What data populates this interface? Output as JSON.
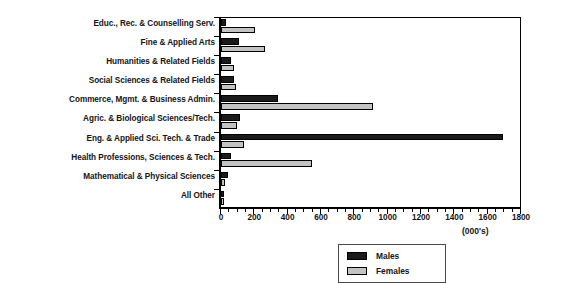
{
  "chart_data": {
    "type": "bar",
    "orientation": "horizontal",
    "title": "",
    "xlabel": "(000's)",
    "ylabel": "",
    "xlim": [
      0,
      1800
    ],
    "xticks": [
      0,
      200,
      400,
      600,
      800,
      1000,
      1200,
      1400,
      1600,
      1800
    ],
    "xtick_labels": [
      "0",
      "200",
      "400",
      "600",
      "800",
      "1000",
      "1200",
      "1400",
      "1600",
      "1800"
    ],
    "minor_tick_step": 50,
    "grid": false,
    "legend_position": "bottom-right",
    "categories": [
      "Educ., Rec. & Counselling Serv.",
      "Fine & Applied Arts",
      "Humanities & Related Fields",
      "Social Sciences & Related Fields",
      "Commerce, Mgmt. & Business Admin.",
      "Agric. & Biological Sciences/Tech.",
      "Eng. & Applied Sci. Tech. & Trade",
      "Health Professions, Sciences & Tech.",
      "Mathematical & Physical Sciences",
      "All Other"
    ],
    "series": [
      {
        "name": "Males",
        "color": "#1a1a1a",
        "values": [
          30,
          105,
          60,
          80,
          340,
          115,
          1690,
          60,
          40,
          20
        ]
      },
      {
        "name": "Females",
        "color": "#c3c3c3",
        "values": [
          205,
          265,
          75,
          90,
          910,
          95,
          140,
          545,
          25,
          15
        ]
      }
    ]
  },
  "legend": {
    "items": [
      {
        "label": "Males",
        "swatch": "males"
      },
      {
        "label": "Females",
        "swatch": "females"
      }
    ]
  },
  "axis": {
    "units_note": "(000's)"
  }
}
